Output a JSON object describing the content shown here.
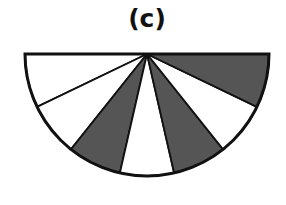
{
  "figure": {
    "label": "(c)",
    "shape": "semicircle",
    "center": [
      147,
      54
    ],
    "radius": 122,
    "sectors": 7,
    "colors": {
      "shaded": "#555555",
      "unshaded": "#ffffff",
      "stroke": "#111111"
    },
    "sector_fill_order_left_to_right": [
      "white",
      "white",
      "shaded",
      "white",
      "shaded",
      "white",
      "shaded"
    ]
  }
}
